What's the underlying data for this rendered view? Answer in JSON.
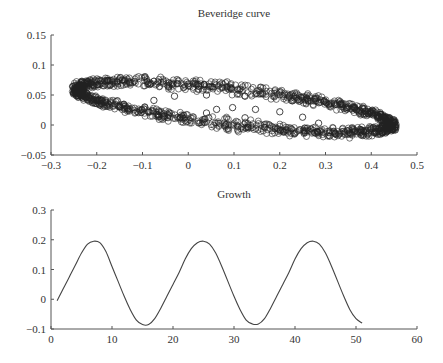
{
  "chart_data": [
    {
      "type": "scatter",
      "title": "Beveridge curve",
      "xlabel": "",
      "ylabel": "",
      "xlim": [
        -0.3,
        0.5
      ],
      "ylim": [
        -0.05,
        0.15
      ],
      "xticks": [
        -0.3,
        -0.2,
        -0.1,
        0,
        0.1,
        0.2,
        0.3,
        0.4,
        0.5
      ],
      "xtick_labels": [
        "-0.3",
        "-0.2",
        "-0.1",
        "0",
        "0.1",
        "0.2",
        "0.3",
        "0.4",
        "0.5"
      ],
      "yticks": [
        -0.05,
        0,
        0.05,
        0.1,
        0.15
      ],
      "ytick_labels": [
        "-0.05",
        "0",
        "0.05",
        "0.1",
        "0.15"
      ],
      "grid": false,
      "marker": "open-circle",
      "description": "Dense ring of points forming a tilted ellipse centered near (0.1, 0.03), spanning x from about -0.25 to 0.45 and y from about -0.03 to 0.08, with a few sparse points inside",
      "ellipse": {
        "cx": 0.1,
        "cy": 0.03,
        "rx": 0.345,
        "ry": 0.03,
        "tilt_slope": -0.085,
        "band": 0.012
      },
      "inner_points": [
        [
          -0.095,
          0.03
        ],
        [
          -0.075,
          0.041
        ],
        [
          -0.03,
          0.048
        ],
        [
          0.04,
          0.05
        ],
        [
          0.04,
          0.02
        ],
        [
          0.045,
          0.012
        ],
        [
          0.062,
          0.026
        ],
        [
          0.097,
          0.029
        ],
        [
          0.124,
          0.048
        ],
        [
          0.124,
          0.012
        ],
        [
          0.147,
          0.026
        ],
        [
          0.2,
          0.022
        ],
        [
          0.25,
          0.013
        ],
        [
          0.285,
          0.003
        ]
      ]
    },
    {
      "type": "line",
      "title": "Growth",
      "xlabel": "",
      "ylabel": "",
      "xlim": [
        0,
        60
      ],
      "ylim": [
        -0.1,
        0.3
      ],
      "xticks": [
        0,
        10,
        20,
        30,
        40,
        50,
        60
      ],
      "xtick_labels": [
        "0",
        "10",
        "20",
        "30",
        "40",
        "50",
        "60"
      ],
      "yticks": [
        -0.1,
        0,
        0.1,
        0.2,
        0.3
      ],
      "ytick_labels": [
        "-0.1",
        "0",
        "0.1",
        "0.2",
        "0.3"
      ],
      "grid": false,
      "series": [
        {
          "name": "Growth",
          "x": [
            1,
            2,
            3,
            4,
            5,
            6,
            7,
            8,
            9,
            10,
            11,
            12,
            13,
            14,
            15,
            16,
            17,
            18,
            19,
            20,
            21,
            22,
            23,
            24,
            25,
            26,
            27,
            28,
            29,
            30,
            31,
            32,
            33,
            34,
            35,
            36,
            37,
            38,
            39,
            40,
            41,
            42,
            43,
            44,
            45,
            46,
            47,
            48,
            49,
            50,
            51
          ],
          "values": [
            -0.005,
            0.035,
            0.075,
            0.115,
            0.155,
            0.185,
            0.195,
            0.19,
            0.16,
            0.11,
            0.06,
            0.01,
            -0.035,
            -0.07,
            -0.085,
            -0.085,
            -0.065,
            -0.03,
            0.01,
            0.05,
            0.09,
            0.135,
            0.17,
            0.19,
            0.195,
            0.185,
            0.155,
            0.11,
            0.06,
            0.01,
            -0.035,
            -0.07,
            -0.083,
            -0.083,
            -0.065,
            -0.03,
            0.01,
            0.05,
            0.09,
            0.135,
            0.17,
            0.19,
            0.195,
            0.185,
            0.155,
            0.11,
            0.06,
            0.01,
            -0.035,
            -0.065,
            -0.08
          ]
        }
      ]
    }
  ]
}
